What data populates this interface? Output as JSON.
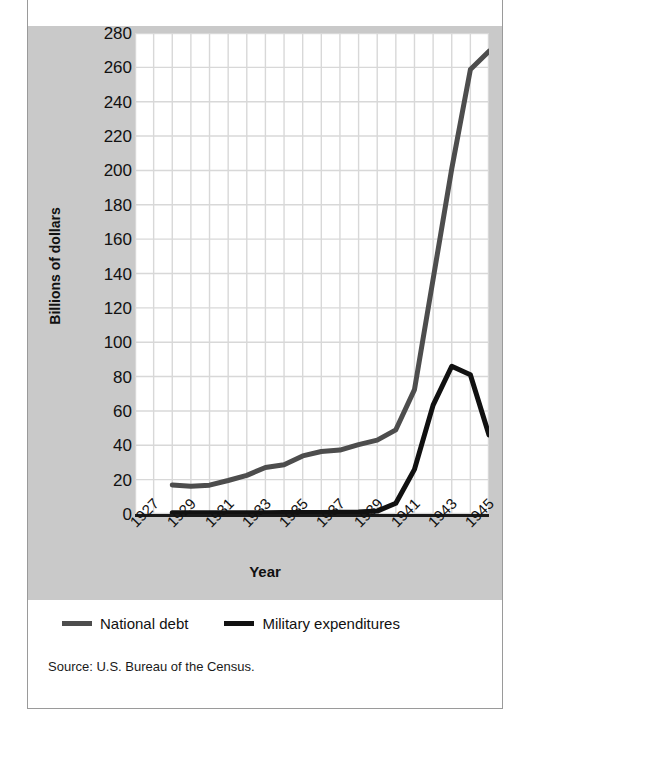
{
  "figure": {
    "title": "",
    "source_note": "Source: U.S. Bureau of the Census.",
    "background_band_color": "#c9c9c9",
    "plot_background_color": "#ffffff",
    "grid_color": "#d8d8d8"
  },
  "legend": {
    "position": "below-plot",
    "items": [
      {
        "label": "National debt",
        "color": "#4d4d4d"
      },
      {
        "label": "Military expenditures",
        "color": "#111111"
      }
    ]
  },
  "chart_data": {
    "type": "line",
    "title": "",
    "subtitle": "",
    "xlabel": "Year",
    "ylabel": "Billions of dollars",
    "xlim": [
      1927,
      1946
    ],
    "ylim": [
      0,
      280
    ],
    "ytick_step": 20,
    "yticks": [
      0,
      20,
      40,
      60,
      80,
      100,
      120,
      140,
      160,
      180,
      200,
      220,
      240,
      260,
      280
    ],
    "xticks": [
      1927,
      1929,
      1931,
      1933,
      1935,
      1937,
      1939,
      1941,
      1943,
      1945
    ],
    "xtick_labels": [
      "1927",
      "1929",
      "1931",
      "1933",
      "1935",
      "1937",
      "1939",
      "1941",
      "1943",
      "1945"
    ],
    "grid": true,
    "grid_x_minor_step": 1,
    "x": [
      1927,
      1928,
      1929,
      1930,
      1931,
      1932,
      1933,
      1934,
      1935,
      1936,
      1937,
      1938,
      1939,
      1940,
      1941,
      1942,
      1943,
      1944,
      1945,
      1946
    ],
    "series": [
      {
        "name": "National debt",
        "color": "#4d4d4d",
        "line_width": 5,
        "values": [
          null,
          null,
          16.9,
          16.2,
          16.8,
          19.5,
          22.5,
          27.1,
          28.7,
          33.8,
          36.4,
          37.2,
          40.4,
          43.0,
          49.0,
          72.4,
          136.7,
          201.0,
          258.7,
          269.4
        ]
      },
      {
        "name": "Military expenditures",
        "color": "#111111",
        "line_width": 5,
        "values": [
          null,
          null,
          0.7,
          0.7,
          0.7,
          0.7,
          0.7,
          0.7,
          0.9,
          0.9,
          0.9,
          1.0,
          1.2,
          1.7,
          6.3,
          26.0,
          63.4,
          86.0,
          81.0,
          46.0
        ]
      }
    ]
  }
}
